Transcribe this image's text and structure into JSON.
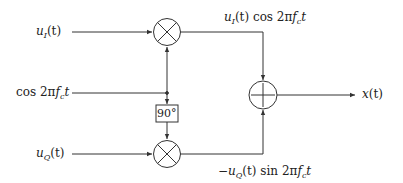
{
  "diagram": {
    "type": "quadrature-modulator-block-diagram",
    "inputs": {
      "in_phase": {
        "var": "u",
        "sub": "I",
        "arg": "(t)"
      },
      "carrier": {
        "fn": "cos 2π",
        "var": "f",
        "sub": "c",
        "tail": "t"
      },
      "quadrature": {
        "var": "u",
        "sub": "Q",
        "arg": "(t)"
      }
    },
    "blocks": {
      "multiplier_top": {
        "symbol": "×"
      },
      "multiplier_bottom": {
        "symbol": "×"
      },
      "phase_shift": {
        "label": "90°"
      },
      "adder": {
        "symbol": "+"
      }
    },
    "signals": {
      "upper_branch": {
        "var": "u",
        "sub": "I",
        "arg": "(t)",
        "fn": " cos 2π",
        "var2": "f",
        "sub2": "c",
        "tail": "t"
      },
      "lower_branch": {
        "sign": "−",
        "var": "u",
        "sub": "Q",
        "arg": "(t)",
        "fn": " sin 2π",
        "var2": "f",
        "sub2": "c",
        "tail": "t"
      }
    },
    "output": {
      "var": "x",
      "arg": "(t)"
    },
    "colors": {
      "stroke": "#333333",
      "background": "#ffffff"
    }
  }
}
